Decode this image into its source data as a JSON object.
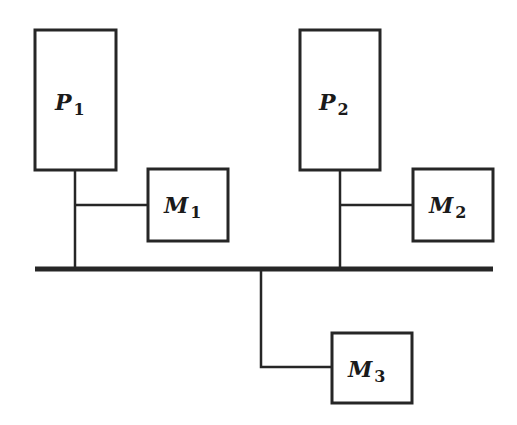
{
  "diagram": {
    "title": "",
    "nodes": [
      {
        "id": "P1",
        "kind": "processor",
        "letter": "P",
        "subscript": "1",
        "x": 35,
        "y": 30,
        "w": 81,
        "h": 140
      },
      {
        "id": "M1",
        "kind": "memory",
        "letter": "M",
        "subscript": "1",
        "x": 148,
        "y": 169,
        "w": 80,
        "h": 72
      },
      {
        "id": "P2",
        "kind": "processor",
        "letter": "P",
        "subscript": "2",
        "x": 300,
        "y": 30,
        "w": 80,
        "h": 140
      },
      {
        "id": "M2",
        "kind": "memory",
        "letter": "M",
        "subscript": "2",
        "x": 413,
        "y": 169,
        "w": 80,
        "h": 72
      },
      {
        "id": "M3",
        "kind": "memory",
        "letter": "M",
        "subscript": "3",
        "x": 332,
        "y": 333,
        "w": 80,
        "h": 70
      }
    ],
    "bus": {
      "x1": 35,
      "x2": 493,
      "y": 269
    },
    "edges": [
      {
        "from": "P1",
        "to": "bus"
      },
      {
        "from": "M1",
        "to": "P1-bus-link"
      },
      {
        "from": "P2",
        "to": "bus"
      },
      {
        "from": "M2",
        "to": "P2-bus-link"
      },
      {
        "from": "bus",
        "to": "M3"
      }
    ]
  }
}
